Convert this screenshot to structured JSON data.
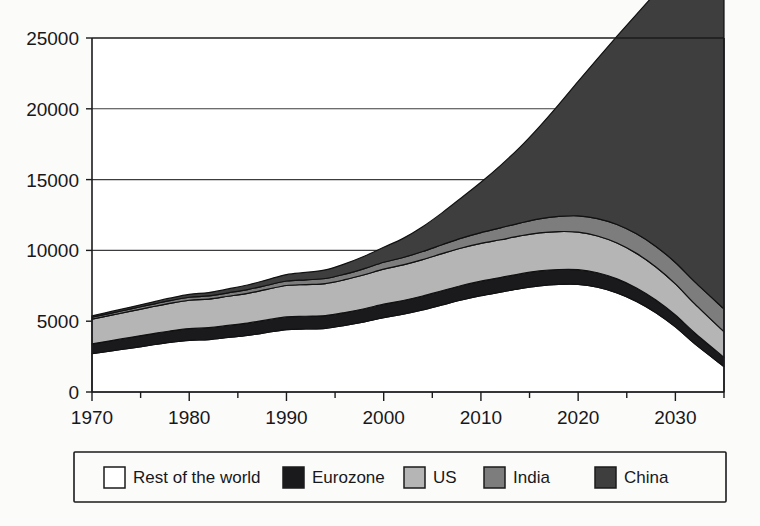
{
  "chart_data": {
    "type": "area",
    "stacked": true,
    "title": "",
    "subtitle": "",
    "xlabel": "",
    "ylabel": "",
    "xlim": [
      1970,
      2035
    ],
    "ylim": [
      0,
      25000
    ],
    "y_ticks": [
      0,
      5000,
      10000,
      15000,
      20000,
      25000
    ],
    "y_tick_labels": [
      "0",
      "5000",
      "10000",
      "15000",
      "20000",
      "25000"
    ],
    "x_ticks": [
      1970,
      1980,
      1990,
      2000,
      2010,
      2020,
      2030
    ],
    "x_tick_labels": [
      "1970",
      "1980",
      "1990",
      "2000",
      "2010",
      "2020",
      "2030"
    ],
    "x_minor_ticks": [
      1975,
      1985,
      1995,
      2005,
      2015,
      2025,
      2035
    ],
    "grid": "horizontal",
    "legend_position": "bottom",
    "x": [
      1970,
      1972,
      1974,
      1976,
      1978,
      1980,
      1982,
      1984,
      1986,
      1988,
      1990,
      1992,
      1994,
      1996,
      1998,
      2000,
      2002,
      2004,
      2006,
      2008,
      2010,
      2012,
      2014,
      2016,
      2018,
      2020,
      2022,
      2024,
      2026,
      2028,
      2030,
      2032,
      2035
    ],
    "series": [
      {
        "name": "Rest of the world",
        "color": "#ffffff",
        "values": [
          2700,
          2900,
          3100,
          3300,
          3500,
          3650,
          3700,
          3850,
          4000,
          4200,
          4400,
          4450,
          4500,
          4700,
          4950,
          5250,
          5500,
          5800,
          6150,
          6500,
          6800,
          7050,
          7300,
          7500,
          7600,
          7600,
          7400,
          7000,
          6400,
          5600,
          4600,
          3400,
          1800
        ]
      },
      {
        "name": "Eurozone",
        "color": "#1a1a1c",
        "values": [
          700,
          730,
          760,
          790,
          810,
          830,
          840,
          850,
          870,
          890,
          900,
          900,
          900,
          910,
          930,
          950,
          960,
          980,
          1000,
          1020,
          1030,
          1030,
          1040,
          1050,
          1050,
          1040,
          1020,
          990,
          950,
          900,
          840,
          770,
          650
        ]
      },
      {
        "name": "US",
        "color": "#b5b5b5",
        "values": [
          1750,
          1800,
          1850,
          1900,
          1950,
          2000,
          2020,
          2060,
          2100,
          2160,
          2220,
          2240,
          2260,
          2320,
          2400,
          2480,
          2520,
          2570,
          2620,
          2650,
          2660,
          2670,
          2680,
          2690,
          2680,
          2650,
          2600,
          2530,
          2440,
          2330,
          2200,
          2050,
          1800
        ]
      },
      {
        "name": "India",
        "color": "#7d7d7d",
        "values": [
          130,
          145,
          160,
          175,
          190,
          210,
          225,
          245,
          265,
          290,
          320,
          335,
          355,
          390,
          430,
          480,
          520,
          570,
          630,
          700,
          770,
          840,
          910,
          990,
          1070,
          1150,
          1230,
          1310,
          1380,
          1450,
          1510,
          1560,
          1620
        ]
      },
      {
        "name": "China",
        "color": "#3e3e3e",
        "values": [
          100,
          115,
          130,
          150,
          175,
          205,
          235,
          275,
          320,
          380,
          450,
          520,
          610,
          730,
          880,
          1060,
          1350,
          1750,
          2250,
          2850,
          3550,
          4400,
          5350,
          6500,
          7900,
          9500,
          11300,
          13300,
          15500,
          17900,
          20350,
          22600,
          24550
        ]
      }
    ],
    "totals_note": "top of stack reaches approximately 24900 at 2035"
  },
  "legend": {
    "entries": [
      {
        "label": "Rest of the world",
        "color": "#ffffff"
      },
      {
        "label": "Eurozone",
        "color": "#1a1a1c"
      },
      {
        "label": "US",
        "color": "#b5b5b5"
      },
      {
        "label": "India",
        "color": "#7d7d7d"
      },
      {
        "label": "China",
        "color": "#3e3e3e"
      }
    ]
  },
  "colors": {
    "axis": "#1b1b1d",
    "grid": "#3c3c3e",
    "text": "#18181a",
    "background": "#fbfbfa"
  }
}
